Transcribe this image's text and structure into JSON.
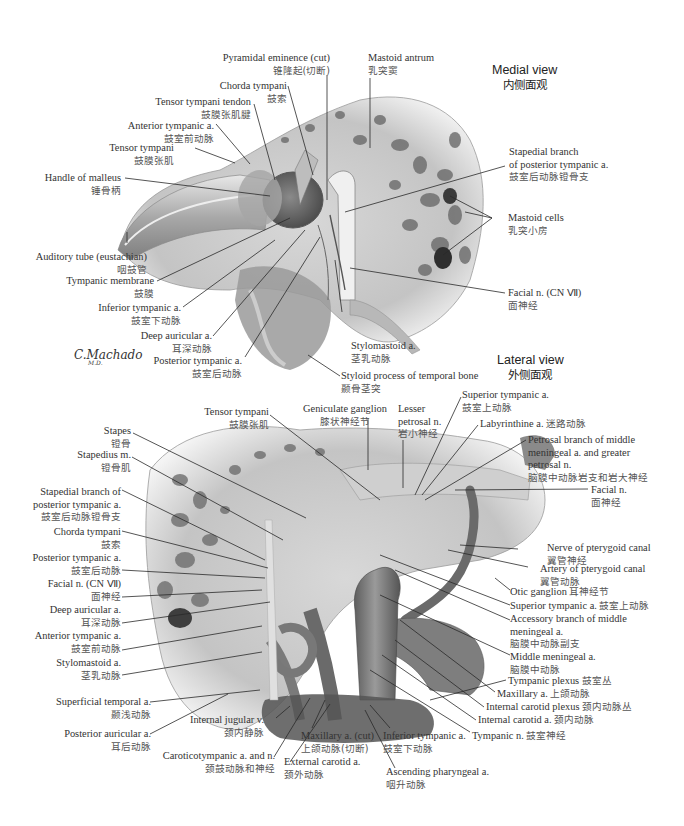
{
  "figure": {
    "signature": "C.Machado",
    "signature_sub": "M.D.",
    "colors": {
      "background": "#ffffff",
      "bone": "#e6e6e6",
      "tissue": "#9a9a9a",
      "vessel": "#6e6e6e",
      "leader": "#2a2a2a",
      "text": "#333333"
    }
  },
  "medial_view": {
    "title": "Medial view",
    "title_zh": "内侧面观",
    "labels": [
      {
        "en": "Pyramidal eminence (cut)",
        "zh": "锥隆起(切断)"
      },
      {
        "en": "Mastoid antrum",
        "zh": "乳突窦"
      },
      {
        "en": "Chorda tympani",
        "zh": "鼓索"
      },
      {
        "en": "Tensor tympani tendon",
        "zh": "鼓膜张肌腱"
      },
      {
        "en": "Anterior tympanic a.",
        "zh": "鼓室前动脉"
      },
      {
        "en": "Tensor tympani",
        "zh": "鼓膜张肌"
      },
      {
        "en": "Handle of malleus",
        "zh": "锤骨柄"
      },
      {
        "en": "Stapedial branch",
        "en2": "of posterior tympanic a.",
        "zh": "鼓室后动脉镫骨支"
      },
      {
        "en": "Mastoid cells",
        "zh": "乳突小房"
      },
      {
        "en": "Auditory tube (eustachian)",
        "zh": "咽鼓管"
      },
      {
        "en": "Tympanic membrane",
        "zh": "鼓膜"
      },
      {
        "en": "Inferior tympanic a.",
        "zh": "鼓室下动脉"
      },
      {
        "en": "Facial n. (CN Ⅶ)",
        "zh": "面神经"
      },
      {
        "en": "Deep auricular a.",
        "zh": "耳深动脉"
      },
      {
        "en": "Posterior tympanic a.",
        "zh": "鼓室后动脉"
      },
      {
        "en": "Stylomastoid a.",
        "zh": "茎乳动脉"
      },
      {
        "en": "Styloid process of temporal bone",
        "zh": "颞骨茎突"
      }
    ]
  },
  "lateral_view": {
    "title": "Lateral view",
    "title_zh": "外侧面观",
    "labels": [
      {
        "en": "Superior tympanic a.",
        "zh": "鼓室上动脉"
      },
      {
        "en": "Tensor tympani",
        "zh": "鼓膜张肌"
      },
      {
        "en": "Geniculate ganglion",
        "zh": "膝状神经节"
      },
      {
        "en": "Lesser",
        "en2": "petrosal n.",
        "zh": "岩小神经"
      },
      {
        "en": "Labyrinthine a.",
        "zh": "迷路动脉"
      },
      {
        "en": "Stapes",
        "zh": "镫骨"
      },
      {
        "en": "Stapedius m.",
        "zh": "镫骨肌"
      },
      {
        "en": "Petrosal branch of middle",
        "en2": "meningeal a. and greater",
        "en3": "petrosal n.",
        "zh": "脑膜中动脉岩支和岩大神经"
      },
      {
        "en": "Facial n.",
        "zh": "面神经"
      },
      {
        "en": "Stapedial branch of",
        "en2": "posterior tympanic a.",
        "zh": "鼓室后动脉镫骨支"
      },
      {
        "en": "Chorda tympani",
        "zh": "鼓索"
      },
      {
        "en": "Nerve of pterygoid canal",
        "zh": "翼管神经"
      },
      {
        "en": "Artery of pterygoid canal",
        "zh": "翼管动脉"
      },
      {
        "en": "Posterior tympanic a.",
        "zh": "鼓室后动脉"
      },
      {
        "en": "Otic ganglion",
        "zh": "耳神经节"
      },
      {
        "en": "Facial n. (CN Ⅶ)",
        "zh": "面神经"
      },
      {
        "en": "Superior tympanic a.",
        "zh": "鼓室上动脉"
      },
      {
        "en": "Accessory branch of  middle",
        "en2": " meningeal a.",
        "zh": "脑膜中动脉副支"
      },
      {
        "en": "Deep auricular a.",
        "zh": "耳深动脉"
      },
      {
        "en": "Anterior tympanic a.",
        "zh": "鼓室前动脉"
      },
      {
        "en": "Middle meningeal a.",
        "zh": "脑膜中动脉"
      },
      {
        "en": "Stylomastoid a.",
        "zh": "茎乳动脉"
      },
      {
        "en": "Tympanic plexus",
        "zh": "鼓室丛"
      },
      {
        "en": "Maxillary a.",
        "zh": "上颌动脉"
      },
      {
        "en": "Superficial temporal a.",
        "zh": "颞浅动脉"
      },
      {
        "en": "Internal carotid plexus",
        "zh": "颈内动脉丛"
      },
      {
        "en": "Internal jugular v.",
        "zh": "颈内静脉"
      },
      {
        "en": "Internal carotid a.",
        "zh": "颈内动脉"
      },
      {
        "en": "Posterior auricular a.",
        "zh": "耳后动脉"
      },
      {
        "en": "Maxillary a. (cut)",
        "zh": "上颌动脉(切断)"
      },
      {
        "en": "Inferior tympanic a.",
        "zh": "鼓室下动脉"
      },
      {
        "en": "Tympanic n.",
        "zh": "鼓室神经"
      },
      {
        "en": "Caroticotympanic  a. and n.",
        "zh": "颈鼓动脉和神经"
      },
      {
        "en": "External carotid a.",
        "zh": "颈外动脉"
      },
      {
        "en": "Ascending pharyngeal a.",
        "zh": "咽升动脉"
      }
    ]
  }
}
